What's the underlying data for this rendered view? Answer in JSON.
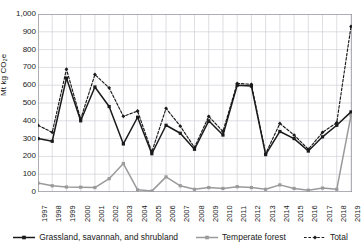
{
  "chart_data": {
    "type": "line",
    "title": "",
    "xlabel": "",
    "ylabel": "Mt kg CO₂e",
    "ylim": [
      0,
      1000
    ],
    "ytick_values": [
      0,
      100,
      200,
      300,
      400,
      500,
      600,
      700,
      800,
      900,
      1000
    ],
    "ytick_labels": [
      "0",
      "100",
      "200",
      "300",
      "400",
      "500",
      "600",
      "700",
      "800",
      "900",
      "1,000"
    ],
    "grid": true,
    "legend_position": "bottom",
    "categories": [
      "1997",
      "1998",
      "1999",
      "2000",
      "2001",
      "2002",
      "2003",
      "2004",
      "2005",
      "2006",
      "2007",
      "2008",
      "2009",
      "2010",
      "2011",
      "2012",
      "2013",
      "2014",
      "2015",
      "2016",
      "2017",
      "2018",
      "2019"
    ],
    "series": [
      {
        "name": "Grassland, savannah, and shrubland",
        "color": "#1a1a1a",
        "style": "solid",
        "marker": "square",
        "values": [
          300,
          285,
          640,
          400,
          590,
          480,
          270,
          420,
          215,
          375,
          330,
          240,
          400,
          320,
          600,
          595,
          210,
          340,
          300,
          230,
          310,
          375,
          450
        ]
      },
      {
        "name": "Temperate forest",
        "color": "#9a9a9a",
        "style": "solid",
        "marker": "square",
        "values": [
          50,
          35,
          28,
          27,
          25,
          75,
          160,
          12,
          5,
          85,
          35,
          15,
          25,
          20,
          30,
          25,
          15,
          40,
          20,
          10,
          22,
          15,
          430
        ]
      },
      {
        "name": "Total",
        "color": "#1a1a1a",
        "style": "dashed",
        "marker": "diamond",
        "values": [
          375,
          335,
          690,
          410,
          660,
          585,
          425,
          455,
          225,
          470,
          370,
          250,
          425,
          340,
          610,
          605,
          215,
          385,
          320,
          240,
          335,
          390,
          930
        ]
      }
    ]
  },
  "legend": {
    "items": [
      {
        "label": "Grassland, savannah, and shrubland"
      },
      {
        "label": "Temperate forest"
      },
      {
        "label": "Total"
      }
    ]
  }
}
